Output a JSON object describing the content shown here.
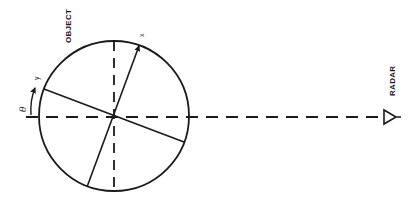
{
  "diagram": {
    "labels": {
      "object": "OBJECT",
      "radar": "RADAR",
      "x_axis": "x",
      "y_axis": "y",
      "angle": "θ"
    },
    "colors": {
      "stroke": "#1a1a1a",
      "background": "#ffffff"
    },
    "geometry": {
      "circle_center": [
        114,
        116
      ],
      "circle_radius": 75,
      "line_of_sight_y": 117,
      "radar_position": [
        384,
        117
      ]
    }
  }
}
